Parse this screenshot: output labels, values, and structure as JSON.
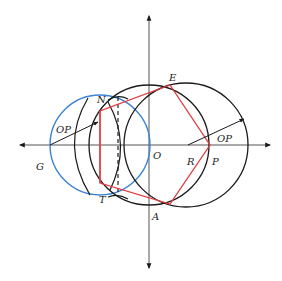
{
  "diagram": {
    "colors": {
      "axis": "#555555",
      "circle_black": "#1a1a1a",
      "circle_blue": "#3a84d6",
      "polygon_red": "#e0393e",
      "dashed": "#222222"
    },
    "labels": {
      "E": "E",
      "N": "N",
      "O": "O",
      "OP_left": "OP",
      "OP_right": "OP",
      "G": "G",
      "R": "R",
      "P": "P",
      "T": "T",
      "A": "A"
    }
  }
}
